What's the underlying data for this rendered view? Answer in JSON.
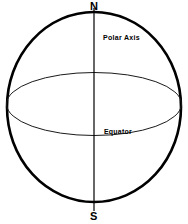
{
  "diagram": {
    "type": "sphere-coordinate-diagram",
    "background_color": "#ffffff",
    "stroke_color": "#000000",
    "labels": {
      "north_pole": "N",
      "south_pole": "S",
      "polar_axis": "Polar Axis",
      "equator": "Equator"
    },
    "geometry": {
      "sphere": {
        "center_x": 94,
        "center_y": 107,
        "radius_x": 88,
        "radius_y": 96,
        "stroke_width": 2.6,
        "fill": "none"
      },
      "equator_ellipse": {
        "center_x": 94,
        "center_y": 104,
        "radius_x": 88,
        "radius_y": 32,
        "stroke_width": 1,
        "fill": "none"
      },
      "polar_axis_line": {
        "x": 94,
        "y_start": 8,
        "y_end": 210,
        "stroke_width": 1.2
      }
    }
  }
}
